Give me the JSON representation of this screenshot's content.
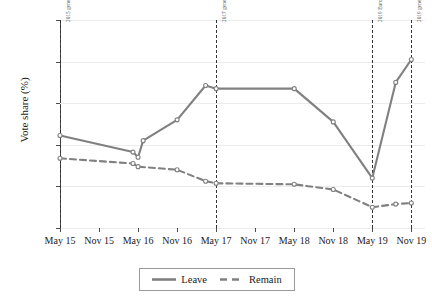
{
  "chart_data": {
    "type": "line",
    "title": "",
    "xlabel": "",
    "ylabel": "Vote share (%)",
    "ylim": [
      0,
      100
    ],
    "yticks": [
      0,
      20,
      40,
      60,
      80,
      100
    ],
    "grid": true,
    "legend_position": "bottom-center",
    "categories": [
      "May 15",
      "Nov 15",
      "May 16",
      "Nov 16",
      "May 17",
      "Nov 17",
      "May 18",
      "Nov 18",
      "May 19",
      "Nov 19"
    ],
    "x": [
      2015.37,
      2015.9,
      2016.33,
      2016.42,
      2016.62,
      2016.85,
      2017.37,
      2017.45,
      2018.3,
      2018.87,
      2019.37,
      2019.72,
      2019.92
    ],
    "series": [
      {
        "name": "Leave",
        "style": "solid",
        "color": "#808080",
        "points": [
          {
            "x": "May 15",
            "value": 44.5
          },
          {
            "x": "Mar 16",
            "value": 36.5
          },
          {
            "x": "May 16",
            "value": 34.0
          },
          {
            "x": "Jun 16",
            "value": 42.0
          },
          {
            "x": "Nov 16",
            "value": 52.0
          },
          {
            "x": "Apr 17",
            "value": 68.5
          },
          {
            "x": "May 17",
            "value": 67.0
          },
          {
            "x": "May 18",
            "value": 67.0
          },
          {
            "x": "Nov 18",
            "value": 51.0
          },
          {
            "x": "May 19",
            "value": 24.0
          },
          {
            "x": "Sep 19",
            "value": 70.0
          },
          {
            "x": "Nov 19",
            "value": 81.0
          }
        ]
      },
      {
        "name": "Remain",
        "style": "dashed",
        "color": "#808080",
        "points": [
          {
            "x": "May 15",
            "value": 33.5
          },
          {
            "x": "Mar 16",
            "value": 31.0
          },
          {
            "x": "May 16",
            "value": 29.5
          },
          {
            "x": "Nov 16",
            "value": 28.0
          },
          {
            "x": "Apr 17",
            "value": 22.5
          },
          {
            "x": "May 17",
            "value": 21.5
          },
          {
            "x": "May 18",
            "value": 21.0
          },
          {
            "x": "Nov 18",
            "value": 18.5
          },
          {
            "x": "May 19",
            "value": 10.0
          },
          {
            "x": "Sep 19",
            "value": 11.5
          },
          {
            "x": "Nov 19",
            "value": 12.0
          }
        ]
      }
    ],
    "event_lines": [
      {
        "label": "2015 general election",
        "x": "May 15"
      },
      {
        "label": "2017 general election",
        "x": "May 17"
      },
      {
        "label": "2019 European Parliament election",
        "x": "May 19"
      },
      {
        "label": "2019 general election",
        "x": "Nov 19"
      }
    ]
  },
  "legend": {
    "items": [
      {
        "label": "Leave",
        "style": "solid"
      },
      {
        "label": "Remain",
        "style": "dashed"
      }
    ]
  }
}
